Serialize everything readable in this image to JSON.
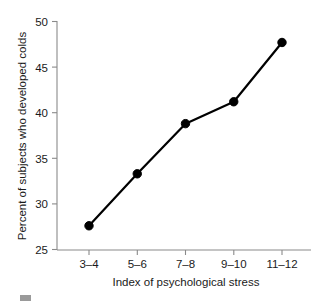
{
  "chart_data": {
    "type": "line",
    "title": "",
    "subtitle": "",
    "xlabel": "Index of psychological stress",
    "ylabel": "Percent of subjects who developed colds",
    "categories": [
      "3–4",
      "5–6",
      "7–8",
      "9–10",
      "11–12"
    ],
    "values": [
      27.6,
      33.3,
      38.8,
      41.2,
      47.7
    ],
    "series": [
      {
        "name": "Percent who developed colds",
        "values": [
          27.6,
          33.3,
          38.8,
          41.2,
          47.7
        ]
      }
    ],
    "ylim": [
      25,
      50
    ],
    "ytick_labels": [
      "25",
      "30",
      "35",
      "40",
      "45",
      "50"
    ],
    "ytick_values": [
      25,
      30,
      35,
      40,
      45,
      50
    ],
    "xtick_labels": [
      "3–4",
      "5–6",
      "7–8",
      "9–10",
      "11–12"
    ],
    "grid": false,
    "legend": false,
    "legend_position": "none",
    "marker": "filled-circle",
    "annotations": []
  },
  "colors": {
    "line": "#000000",
    "marker": "#000000",
    "axis": "#8a8a8a",
    "text": "#1a1a1a",
    "background": "#ffffff",
    "artifact": "#9a9a9a"
  },
  "axes": {
    "y_axis_name": "y-axis",
    "x_axis_name": "x-axis"
  }
}
